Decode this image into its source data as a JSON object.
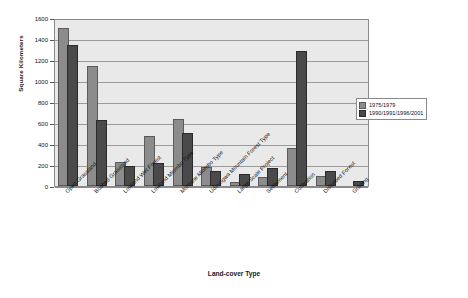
{
  "chart_data": {
    "type": "bar",
    "title": "",
    "xlabel": "Land-cover Type",
    "ylabel": "Square Kilometers",
    "ylim": [
      0,
      1600
    ],
    "ytick_step": 200,
    "yticks": [
      0,
      200,
      400,
      600,
      800,
      1000,
      1200,
      1400,
      1600
    ],
    "grid": true,
    "legend_position": "right",
    "categories": [
      "Open Grassland",
      "Bushed Grassland",
      "Lowland Wet Forest",
      "Lowland Miombo Type",
      "Montane Miombo Type",
      "Udzungwa Mountain Forest Type",
      "Large Scale Project",
      "Settlement",
      "Cultivation",
      "Disturbed Forest",
      "Grazing"
    ],
    "series": [
      {
        "name": "1975/1979",
        "color": "#8c8c8c",
        "values": [
          1490,
          1120,
          210,
          460,
          615,
          160,
          20,
          70,
          345,
          80,
          0
        ]
      },
      {
        "name": "1990/1991/1996/2001",
        "color": "#4a4a4a",
        "values": [
          1320,
          610,
          170,
          200,
          490,
          120,
          95,
          155,
          1265,
          125,
          25
        ]
      }
    ]
  },
  "legend": {
    "entries": [
      {
        "label": "1975/1979"
      },
      {
        "label": "1990/1991/1996/2001"
      }
    ]
  },
  "axes": {
    "y_title": "Square Kilometers",
    "x_title": "Land-cover Type"
  }
}
